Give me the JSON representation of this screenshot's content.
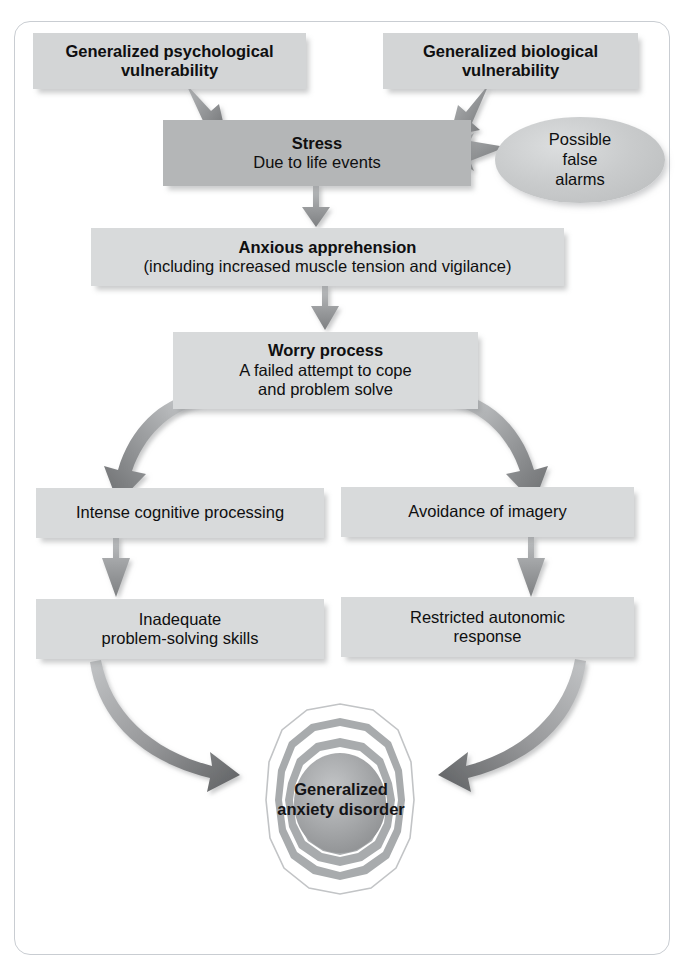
{
  "figure": {
    "type": "flowchart",
    "background": "#ffffff",
    "frame_border_color": "#c9cdd2",
    "box_fill": "#d8dadb",
    "box_fill_emphasis": "#b4b6b7",
    "arrow_fill": "#8f9193",
    "target_ring_fill": "#a8abad"
  },
  "nodes": {
    "gen_psych": {
      "title": "Generalized psychological",
      "subtitle": "vulnerability",
      "bold": true
    },
    "gen_bio": {
      "title": "Generalized biological",
      "subtitle": "vulnerability",
      "bold": true
    },
    "stress": {
      "title": "Stress",
      "subtitle": "Due to life events"
    },
    "false_alarms": {
      "line1": "Possible",
      "line2": "false",
      "line3": "alarms"
    },
    "anxious": {
      "title": "Anxious apprehension",
      "subtitle": "(including increased muscle tension and vigilance)"
    },
    "worry": {
      "title": "Worry process",
      "subtitle": "A failed attempt to cope",
      "subtitle2": "and problem solve"
    },
    "intense": {
      "title": "Intense cognitive processing"
    },
    "avoidance": {
      "title": "Avoidance of imagery"
    },
    "inadequate": {
      "title": "Inadequate",
      "subtitle": "problem-solving skills"
    },
    "restricted": {
      "title": "Restricted autonomic",
      "subtitle": "response"
    },
    "gad": {
      "line1": "Generalized",
      "line2": "anxiety disorder"
    }
  },
  "edges": [
    {
      "from": "gen_psych",
      "to": "stress",
      "style": "straight-arrow"
    },
    {
      "from": "gen_bio",
      "to": "stress",
      "style": "straight-arrow"
    },
    {
      "from": "false_alarms",
      "to": "stress",
      "style": "straight-arrow"
    },
    {
      "from": "stress",
      "to": "anxious",
      "style": "straight-arrow"
    },
    {
      "from": "anxious",
      "to": "worry",
      "style": "straight-arrow"
    },
    {
      "from": "worry",
      "to": "intense",
      "style": "curved-arrow"
    },
    {
      "from": "worry",
      "to": "avoidance",
      "style": "curved-arrow"
    },
    {
      "from": "intense",
      "to": "inadequate",
      "style": "straight-arrow"
    },
    {
      "from": "avoidance",
      "to": "restricted",
      "style": "straight-arrow"
    },
    {
      "from": "inadequate",
      "to": "gad",
      "style": "curved-arrow"
    },
    {
      "from": "restricted",
      "to": "gad",
      "style": "curved-arrow"
    }
  ]
}
